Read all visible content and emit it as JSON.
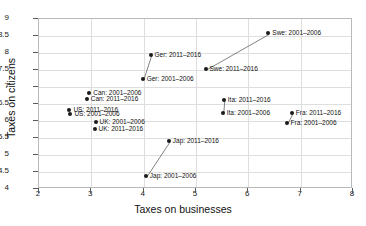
{
  "chart_data": {
    "type": "scatter",
    "title": "",
    "xlabel": "Taxes on businesses",
    "ylabel": "Taxes on citizens",
    "xlim": [
      2,
      8
    ],
    "ylim": [
      4,
      9
    ],
    "xticks": [
      "2",
      "3",
      "4",
      "5",
      "6",
      "7",
      "8"
    ],
    "yticks": [
      "4",
      "4.5",
      "5",
      "5.5",
      "6",
      "6.5",
      "7",
      "7.5",
      "8",
      "8.5",
      "9"
    ],
    "grid": true,
    "legend": "none",
    "annotation_style": "point labels with connector lines between period pairs",
    "points": [
      {
        "label": "Swe: 2001–2006",
        "country": "Swe",
        "period": "2001–2006",
        "x": 6.4,
        "y": 8.55,
        "label_side": "right"
      },
      {
        "label": "Swe: 2011–2016",
        "country": "Swe",
        "period": "2011–2016",
        "x": 5.2,
        "y": 7.5,
        "label_side": "right"
      },
      {
        "label": "Ger: 2011–2016",
        "country": "Ger",
        "period": "2011–2016",
        "x": 4.15,
        "y": 7.9,
        "label_side": "right"
      },
      {
        "label": "Ger: 2001–2006",
        "country": "Ger",
        "period": "2001–2006",
        "x": 4.0,
        "y": 7.2,
        "label_side": "right"
      },
      {
        "label": "Can: 2001–2006",
        "country": "Can",
        "period": "2001–2006",
        "x": 2.98,
        "y": 6.8,
        "label_side": "right"
      },
      {
        "label": "Can: 2011–2016",
        "country": "Can",
        "period": "2011–2016",
        "x": 2.93,
        "y": 6.62,
        "label_side": "right"
      },
      {
        "label": "US: 2011–2016",
        "country": "US",
        "period": "2011–2016",
        "x": 2.6,
        "y": 6.3,
        "label_side": "right"
      },
      {
        "label": "US: 2001–2006",
        "country": "US",
        "period": "2001–2006",
        "x": 2.62,
        "y": 6.18,
        "label_side": "right"
      },
      {
        "label": "UK: 2001–2006",
        "country": "UK",
        "period": "2001–2006",
        "x": 3.1,
        "y": 5.93,
        "label_side": "right"
      },
      {
        "label": "UK: 2011–2016",
        "country": "UK",
        "period": "2011–2016",
        "x": 3.08,
        "y": 5.75,
        "label_side": "right"
      },
      {
        "label": "Ita: 2011–2016",
        "country": "Ita",
        "period": "2011–2016",
        "x": 5.55,
        "y": 6.6,
        "label_side": "right"
      },
      {
        "label": "Ita: 2001–2006",
        "country": "Ita",
        "period": "2001–2006",
        "x": 5.53,
        "y": 6.2,
        "label_side": "right"
      },
      {
        "label": "Fra: 2011–2016",
        "country": "Fra",
        "period": "2011–2016",
        "x": 6.85,
        "y": 6.2,
        "label_side": "right"
      },
      {
        "label": "Fra: 2001–2006",
        "country": "Fra",
        "period": "2001–2006",
        "x": 6.75,
        "y": 5.9,
        "label_side": "right"
      },
      {
        "label": "Jap: 2011–2016",
        "country": "Jap",
        "period": "2011–2016",
        "x": 4.5,
        "y": 5.37,
        "label_side": "right"
      },
      {
        "label": "Jap: 2001–2006",
        "country": "Jap",
        "period": "2001–2006",
        "x": 4.06,
        "y": 4.35,
        "label_side": "right"
      }
    ],
    "connectors": [
      {
        "country": "Swe",
        "from": [
          5.2,
          7.5
        ],
        "to": [
          6.4,
          8.55
        ]
      },
      {
        "country": "Ger",
        "from": [
          4.0,
          7.2
        ],
        "to": [
          4.15,
          7.9
        ]
      },
      {
        "country": "Ita",
        "from": [
          5.53,
          6.2
        ],
        "to": [
          5.55,
          6.6
        ]
      },
      {
        "country": "Fra",
        "from": [
          6.75,
          5.9
        ],
        "to": [
          6.85,
          6.2
        ]
      },
      {
        "country": "Jap",
        "from": [
          4.06,
          4.35
        ],
        "to": [
          4.5,
          5.37
        ]
      }
    ],
    "colors": {
      "marker": "#1a1a1a",
      "connector": "#4d4d4d",
      "grid": "#dedede",
      "frame": "#b9b9b9",
      "text": "#111111",
      "background": "#ffffff"
    }
  }
}
